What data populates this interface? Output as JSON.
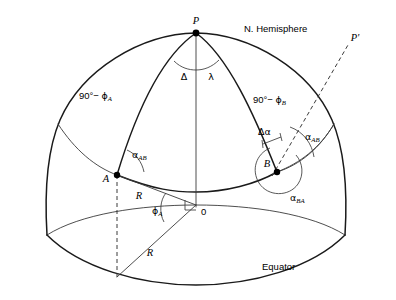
{
  "figure": {
    "title_label": "N. Hemisphere",
    "equator_label": "Equator",
    "origin_label": "0"
  },
  "points": {
    "pole": "P",
    "pole_prime": "P'",
    "station_a": "A",
    "station_b": "B"
  },
  "angles": {
    "delta": "Δ",
    "lambda": "λ",
    "delta_alpha": "Δα",
    "phi_a": "ϕ",
    "phi_a_sub": "A",
    "alpha_ab_left": "α",
    "alpha_ab_left_sub": "AB",
    "alpha_ab_right": "α",
    "alpha_ab_right_sub": "AB",
    "alpha_ba": "α",
    "alpha_ba_sub": "BA"
  },
  "colatitudes": {
    "a_prefix": "90°− ",
    "a_symbol": "ϕ",
    "a_sub": "A",
    "b_prefix": "90°− ",
    "b_symbol": "ϕ",
    "b_sub": "B"
  },
  "radii": {
    "upper": "R",
    "lower": "R"
  },
  "colors": {
    "ink": "#1a1a1a",
    "thin_ink": "#3a3a3a",
    "background": "#ffffff"
  }
}
